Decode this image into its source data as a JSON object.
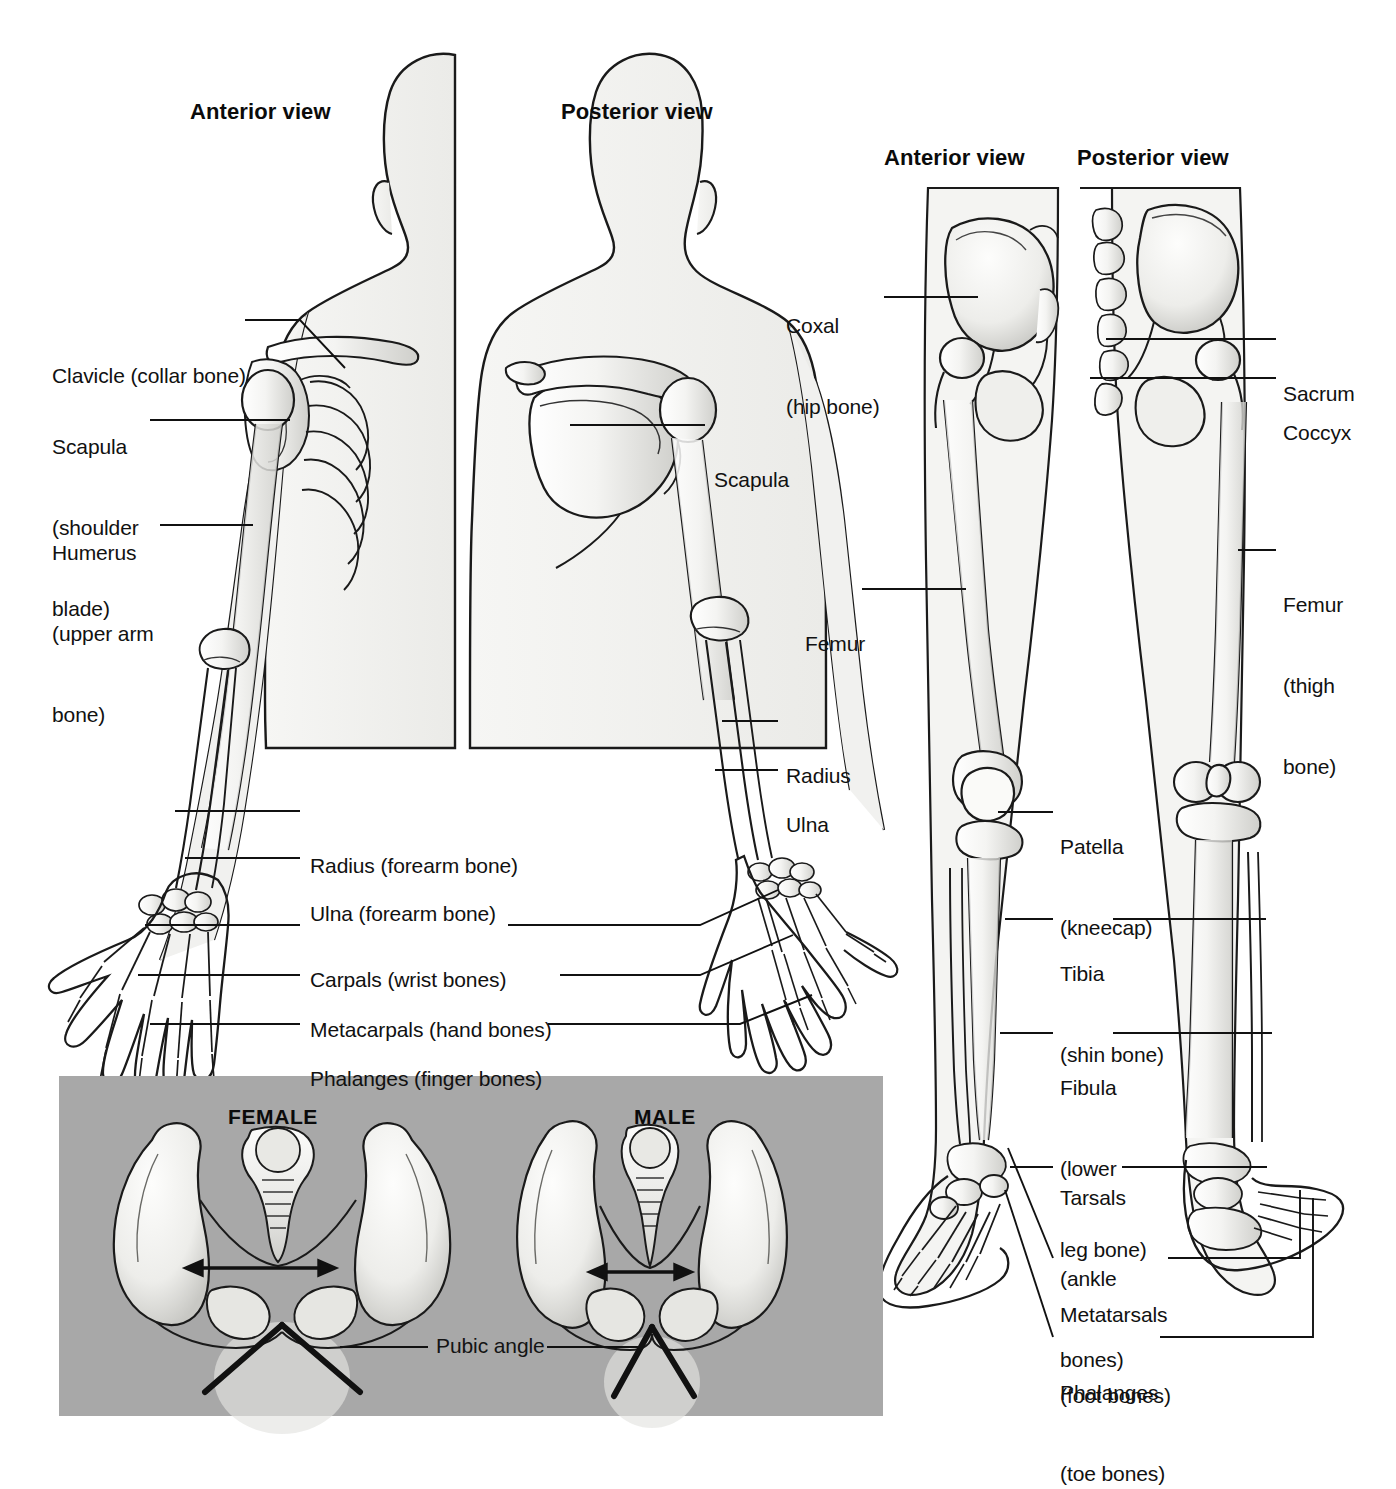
{
  "figure": {
    "title_absent": true,
    "background_color": "#ffffff",
    "panel_gray": "#a8a8a8",
    "line_color": "#111111",
    "bone_fill": "#f0f0ee",
    "body_fill": "#f2f2f0"
  },
  "upper_limb": {
    "headings": [
      {
        "text": "Anterior view",
        "x": 190,
        "y": 99
      },
      {
        "text": "Posterior view",
        "x": 561,
        "y": 99
      }
    ],
    "labels": [
      {
        "id": "clavicle",
        "lines": [
          "Clavicle (collar bone)"
        ],
        "x": 52,
        "y": 308,
        "leader": [
          [
            245,
            320
          ],
          [
            300,
            320
          ],
          [
            345,
            368
          ]
        ]
      },
      {
        "id": "scapula-left",
        "lines": [
          "Scapula",
          "(shoulder",
          "blade)"
        ],
        "x": 52,
        "y": 379,
        "leader": [
          [
            150,
            420
          ],
          [
            290,
            420
          ]
        ]
      },
      {
        "id": "humerus",
        "lines": [
          "Humerus",
          "(upper arm",
          "bone)"
        ],
        "x": 52,
        "y": 485,
        "leader": [
          [
            160,
            525
          ],
          [
            253,
            525
          ]
        ]
      },
      {
        "id": "radius-forearm",
        "lines": [
          "Radius (forearm bone)"
        ],
        "x": 310,
        "y": 798,
        "leader": [
          [
            175,
            811
          ],
          [
            300,
            811
          ]
        ]
      },
      {
        "id": "ulna-forearm",
        "lines": [
          "Ulna (forearm bone)"
        ],
        "x": 310,
        "y": 846,
        "leader": [
          [
            185,
            858
          ],
          [
            300,
            858
          ]
        ]
      },
      {
        "id": "carpals",
        "lines": [
          "Carpals (wrist bones)"
        ],
        "x": 310,
        "y": 912,
        "leader_left": [
          [
            145,
            925
          ],
          [
            300,
            925
          ]
        ],
        "leader_right": [
          [
            508,
            925
          ],
          [
            700,
            925
          ],
          [
            778,
            890
          ]
        ]
      },
      {
        "id": "metacarpals",
        "lines": [
          "Metacarpals (hand bones)"
        ],
        "x": 310,
        "y": 962,
        "leader_left": [
          [
            138,
            975
          ],
          [
            300,
            975
          ]
        ],
        "leader_right": [
          [
            560,
            975
          ],
          [
            700,
            975
          ],
          [
            793,
            935
          ]
        ]
      },
      {
        "id": "phalanges-finger",
        "lines": [
          "Phalanges (finger bones)"
        ],
        "x": 310,
        "y": 1011,
        "leader_left": [
          [
            150,
            1024
          ],
          [
            300,
            1024
          ]
        ],
        "leader_right": [
          [
            548,
            1024
          ],
          [
            740,
            1024
          ],
          [
            812,
            995
          ]
        ]
      },
      {
        "id": "scapula-right",
        "lines": [
          "Scapula"
        ],
        "x": 714,
        "y": 412,
        "leader": [
          [
            570,
            425
          ],
          [
            705,
            425
          ]
        ]
      },
      {
        "id": "radius-post",
        "lines": [
          "Radius"
        ],
        "x": 786,
        "y": 708,
        "leader": [
          [
            722,
            721
          ],
          [
            778,
            721
          ]
        ]
      },
      {
        "id": "ulna-post",
        "lines": [
          "Ulna"
        ],
        "x": 786,
        "y": 757,
        "leader": [
          [
            715,
            770
          ],
          [
            778,
            770
          ]
        ]
      }
    ]
  },
  "lower_limb": {
    "headings": [
      {
        "text": "Anterior view",
        "x": 884,
        "y": 145
      },
      {
        "text": "Posterior view",
        "x": 1077,
        "y": 145
      }
    ],
    "labels": [
      {
        "id": "coxal",
        "lines": [
          "Coxal",
          "(hip bone)"
        ],
        "x": 786,
        "y": 258,
        "leader": [
          [
            884,
            297
          ],
          [
            978,
            297
          ]
        ]
      },
      {
        "id": "sacrum",
        "lines": [
          "Sacrum"
        ],
        "x": 1283,
        "y": 326,
        "leader": [
          [
            1106,
            339
          ],
          [
            1276,
            339
          ]
        ]
      },
      {
        "id": "coccyx",
        "lines": [
          "Coccyx"
        ],
        "x": 1283,
        "y": 365,
        "leader": [
          [
            1090,
            378
          ],
          [
            1276,
            378
          ]
        ]
      },
      {
        "id": "femur-ant",
        "lines": [
          "Femur"
        ],
        "x": 805,
        "y": 576,
        "leader": [
          [
            862,
            589
          ],
          [
            966,
            589
          ]
        ]
      },
      {
        "id": "femur-post",
        "lines": [
          "Femur",
          "(thigh",
          "bone)"
        ],
        "x": 1283,
        "y": 537,
        "leader": [
          [
            1238,
            550
          ],
          [
            1276,
            550
          ]
        ]
      },
      {
        "id": "patella",
        "lines": [
          "Patella",
          "(kneecap)"
        ],
        "x": 1060,
        "y": 779,
        "leader": [
          [
            998,
            812
          ],
          [
            1053,
            812
          ]
        ]
      },
      {
        "id": "tibia",
        "lines": [
          "Tibia",
          "(shin bone)"
        ],
        "x": 1060,
        "y": 906,
        "leader_left": [
          [
            1005,
            919
          ],
          [
            1053,
            919
          ]
        ],
        "leader_right": [
          [
            1113,
            919
          ],
          [
            1266,
            919
          ]
        ]
      },
      {
        "id": "fibula",
        "lines": [
          "Fibula",
          "(lower",
          "leg bone)"
        ],
        "x": 1060,
        "y": 1020,
        "leader_left": [
          [
            1000,
            1033
          ],
          [
            1053,
            1033
          ]
        ],
        "leader_right": [
          [
            1113,
            1033
          ],
          [
            1272,
            1033
          ]
        ]
      },
      {
        "id": "tarsals",
        "lines": [
          "Tarsals",
          "(ankle",
          "bones)"
        ],
        "x": 1060,
        "y": 1130,
        "leader_left": [
          [
            1010,
            1167
          ],
          [
            1053,
            1167
          ]
        ],
        "leader_right": [
          [
            1122,
            1167
          ],
          [
            1267,
            1167
          ]
        ]
      },
      {
        "id": "metatarsals",
        "lines": [
          "Metatarsals",
          "(foot bones)"
        ],
        "x": 1060,
        "y": 1247,
        "leader_left": [
          [
            1008,
            1148
          ],
          [
            1053,
            1258
          ]
        ],
        "leader_right": [
          [
            1168,
            1258
          ],
          [
            1300,
            1258
          ],
          [
            1300,
            1190
          ]
        ]
      },
      {
        "id": "phalanges-toe",
        "lines": [
          "Phalanges",
          "(toe bones)"
        ],
        "x": 1060,
        "y": 1325,
        "leader_left": [
          [
            1005,
            1190
          ],
          [
            1053,
            1337
          ]
        ],
        "leader_right": [
          [
            1160,
            1337
          ],
          [
            1313,
            1337
          ],
          [
            1313,
            1198
          ]
        ]
      }
    ]
  },
  "pelvis_panel": {
    "rect": {
      "x": 59,
      "y": 1076,
      "w": 824,
      "h": 340
    },
    "background": "#a8a8a8",
    "headings": [
      {
        "text": "FEMALE",
        "x": 228,
        "y": 1105
      },
      {
        "text": "MALE",
        "x": 634,
        "y": 1105
      }
    ],
    "label": {
      "text": "Pubic angle",
      "x": 436,
      "y": 1332,
      "leader_left": [
        [
          340,
          1347
        ],
        [
          428,
          1347
        ]
      ],
      "leader_right": [
        [
          547,
          1347
        ],
        [
          640,
          1347
        ]
      ]
    }
  },
  "bone_terms": [
    "Clavicle (collar bone)",
    "Scapula (shoulder blade)",
    "Humerus (upper arm bone)",
    "Radius (forearm bone)",
    "Ulna (forearm bone)",
    "Carpals (wrist bones)",
    "Metacarpals (hand bones)",
    "Phalanges (finger bones)",
    "Coxal (hip bone)",
    "Sacrum",
    "Coccyx",
    "Femur (thigh bone)",
    "Patella (kneecap)",
    "Tibia (shin bone)",
    "Fibula (lower leg bone)",
    "Tarsals (ankle bones)",
    "Metatarsals (foot bones)",
    "Phalanges (toe bones)",
    "Pubic angle"
  ]
}
